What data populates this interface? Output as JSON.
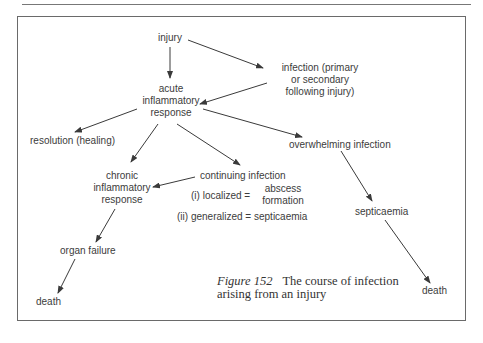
{
  "diagram": {
    "nodes": {
      "injury": "injury",
      "infection": [
        "infection (primary",
        "or secondary",
        "following injury)"
      ],
      "acute": [
        "acute",
        "inflammatory",
        "response"
      ],
      "resolution": "resolution (healing)",
      "overwhelming": "overwhelming infection",
      "chronic": [
        "chronic",
        "inflammatory",
        "response"
      ],
      "continuing": "continuing infection",
      "localized_label": "(i) localized =",
      "localized_value": [
        "abscess",
        "formation"
      ],
      "generalized": "(ii) generalized = septicaemia",
      "septicaemia": "septicaemia",
      "organ_failure": "organ failure",
      "death_left": "death",
      "death_right": "death"
    },
    "edges": [
      [
        "injury",
        "acute"
      ],
      [
        "injury",
        "infection"
      ],
      [
        "infection",
        "acute"
      ],
      [
        "acute",
        "resolution"
      ],
      [
        "acute",
        "chronic"
      ],
      [
        "acute",
        "continuing"
      ],
      [
        "acute",
        "overwhelming"
      ],
      [
        "continuing",
        "chronic"
      ],
      [
        "chronic",
        "organ_failure"
      ],
      [
        "organ_failure",
        "death_left"
      ],
      [
        "overwhelming",
        "septicaemia"
      ],
      [
        "septicaemia",
        "death_right"
      ]
    ],
    "caption": {
      "figure_label": "Figure 152",
      "line1": "The course of infection",
      "line2": "arising from an injury"
    },
    "colors": {
      "line": "#3a3a3a",
      "text": "#3c3c3c",
      "frame": "#6a6a6a"
    }
  }
}
